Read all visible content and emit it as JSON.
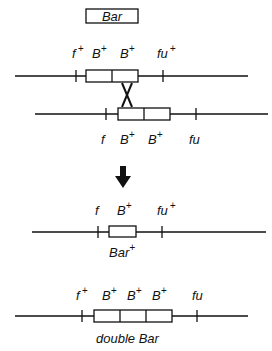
{
  "title_box": {
    "label": "Bar"
  },
  "rows": [
    {
      "id": "row1",
      "labels": [
        {
          "base": "f",
          "sup": "+"
        },
        {
          "base": "B",
          "sup": "+"
        },
        {
          "base": "B",
          "sup": "+"
        },
        {
          "base": "fu",
          "sup": "+"
        }
      ]
    },
    {
      "id": "row2",
      "labels": [
        {
          "base": "f",
          "sup": ""
        },
        {
          "base": "B",
          "sup": "+"
        },
        {
          "base": "B",
          "sup": "+"
        },
        {
          "base": "fu",
          "sup": ""
        }
      ]
    },
    {
      "id": "row3",
      "labels": [
        {
          "base": "f",
          "sup": ""
        },
        {
          "base": "B",
          "sup": "+"
        },
        {
          "base": "fu",
          "sup": "+"
        }
      ],
      "caption": {
        "base": "Bar",
        "sup": "+"
      }
    },
    {
      "id": "row4",
      "labels": [
        {
          "base": "f",
          "sup": "+"
        },
        {
          "base": "B",
          "sup": "+"
        },
        {
          "base": "B",
          "sup": "+"
        },
        {
          "base": "B",
          "sup": "+"
        },
        {
          "base": "fu",
          "sup": ""
        }
      ],
      "caption": {
        "base": "double Bar",
        "sup": ""
      }
    }
  ],
  "arrow": {
    "direction": "down",
    "meaning": "unequal crossing-over result"
  },
  "crossover": {
    "symbol": "X"
  }
}
